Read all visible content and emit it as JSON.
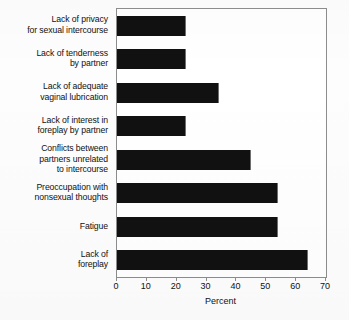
{
  "chart_data": {
    "type": "bar",
    "orientation": "horizontal",
    "title": "",
    "xlabel": "Percent",
    "ylabel": "",
    "xlim": [
      0,
      70
    ],
    "xticks": [
      0,
      10,
      20,
      30,
      40,
      50,
      60,
      70
    ],
    "xtick_labels": [
      "0",
      "10",
      "20",
      "30",
      "40",
      "50",
      "60",
      "70"
    ],
    "grid": false,
    "legend": null,
    "bar_color": "#111111",
    "categories": [
      "Lack of privacy for sexual intercourse",
      "Lack of tenderness by partner",
      "Lack of adequate vaginal lubrication",
      "Lack of interest in foreplay by partner",
      "Conflicts between partners unrelated to intercourse",
      "Preoccupation with nonsexual thoughts",
      "Fatigue",
      "Lack of foreplay"
    ],
    "category_lines": [
      [
        "Lack of privacy",
        "for sexual intercourse"
      ],
      [
        "Lack of tenderness",
        "by partner"
      ],
      [
        "Lack of adequate",
        "vaginal lubrication"
      ],
      [
        "Lack of interest in",
        "foreplay by partner"
      ],
      [
        "Conflicts between",
        "partners unrelated",
        "to intercourse"
      ],
      [
        "Preoccupation with",
        "nonsexual thoughts"
      ],
      [
        "Fatigue"
      ],
      [
        "Lack of",
        "foreplay"
      ]
    ],
    "values": [
      23,
      23,
      34,
      23,
      45,
      54,
      54,
      64
    ]
  }
}
